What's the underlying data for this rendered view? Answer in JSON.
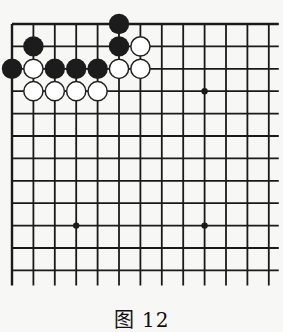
{
  "figure": {
    "caption": "图 12"
  },
  "board": {
    "grid": {
      "columns": 13,
      "rows": 12,
      "origin_x": 12,
      "origin_y": 24,
      "spacing_x": 21.4,
      "spacing_y": 22.4,
      "edges": {
        "top": "closed",
        "left": "closed",
        "right": "open",
        "bottom": "open"
      },
      "line_color": "#1a1a1a"
    },
    "star_points": [
      {
        "col": 9,
        "row": 3
      },
      {
        "col": 3,
        "row": 9
      },
      {
        "col": 9,
        "row": 9
      }
    ],
    "stones": [
      {
        "color": "black",
        "col": 5,
        "row": 0
      },
      {
        "color": "black",
        "col": 1,
        "row": 1
      },
      {
        "color": "black",
        "col": 5,
        "row": 1
      },
      {
        "color": "white",
        "col": 6,
        "row": 1
      },
      {
        "color": "black",
        "col": 0,
        "row": 2
      },
      {
        "color": "white",
        "col": 1,
        "row": 2
      },
      {
        "color": "black",
        "col": 2,
        "row": 2
      },
      {
        "color": "black",
        "col": 3,
        "row": 2
      },
      {
        "color": "black",
        "col": 4,
        "row": 2
      },
      {
        "color": "white",
        "col": 5,
        "row": 2
      },
      {
        "color": "white",
        "col": 6,
        "row": 2
      },
      {
        "color": "white",
        "col": 1,
        "row": 3
      },
      {
        "color": "white",
        "col": 2,
        "row": 3
      },
      {
        "color": "white",
        "col": 3,
        "row": 3
      },
      {
        "color": "white",
        "col": 4,
        "row": 3
      }
    ],
    "colors": {
      "black_stone": "#1c1c1c",
      "white_stone": "#ffffff",
      "white_outline": "#222222"
    }
  }
}
